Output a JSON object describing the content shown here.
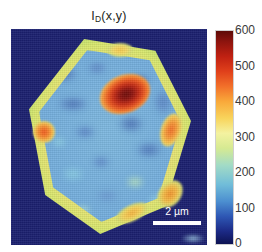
{
  "figure": {
    "title_main": "I",
    "title_sub": "D",
    "title_args": "(x,y)",
    "title_full": "I_D(x,y)"
  },
  "scale_bar": {
    "label": "2 µm",
    "length_um": 2
  },
  "colorbar": {
    "ticks": [
      "600",
      "500",
      "400",
      "300",
      "200",
      "100",
      "0"
    ],
    "min": 0,
    "max": 600,
    "colormap": "jet",
    "background_color": "#1b2070",
    "max_color": "#5e0b08",
    "min_color": "#0d1252"
  },
  "chart_data": {
    "type": "heatmap",
    "xlabel": "",
    "ylabel": "",
    "colorbar_label": "",
    "zlim": [
      0,
      650
    ],
    "z_ticks": [
      0,
      100,
      200,
      300,
      400,
      500,
      600
    ],
    "colormap": "jet",
    "grid": false,
    "legend_position": "right",
    "scale_bar": "2 µm",
    "features": [
      {
        "name": "substrate-background",
        "value": 0,
        "color": "#1b2070",
        "region": "outside flake"
      },
      {
        "name": "flake-edge-ring",
        "value": 170,
        "color": "#f2e07a",
        "region": "hexagon perimeter"
      },
      {
        "name": "flake-interior",
        "value": 70,
        "color": "#74aede",
        "region": "hexagon interior"
      },
      {
        "name": "central-hotspot",
        "value": 630,
        "color": "#6d0f0b",
        "region": "upper-centre"
      },
      {
        "name": "left-edge-hotspot",
        "value": 330,
        "color": "#f05a20",
        "region": "left edge"
      },
      {
        "name": "right-edge-hotspot",
        "value": 290,
        "color": "#f2702a",
        "region": "right edge"
      },
      {
        "name": "lower-left-hotspot",
        "value": 230,
        "color": "#f2a93a",
        "region": "lower-left interior"
      },
      {
        "name": "lower-right-rim",
        "value": 260,
        "color": "#f0922f",
        "region": "lower-right edge"
      }
    ]
  }
}
